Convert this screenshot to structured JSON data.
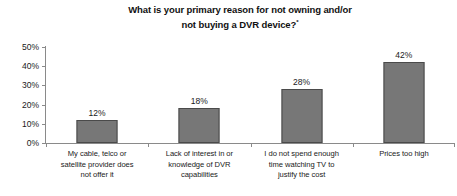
{
  "chart_data": {
    "type": "bar",
    "title": "What is your primary reason for not owning and/or not buying a DVR device?",
    "title_line1": "What is your primary reason for not owning and/or",
    "title_line2": "not buying a DVR device?",
    "title_footnote_mark": "*",
    "xlabel": "",
    "ylabel": "",
    "ylim": [
      0,
      50
    ],
    "grid": false,
    "legend": false,
    "y_ticks": [
      "0%",
      "10%",
      "20%",
      "30%",
      "40%",
      "50%"
    ],
    "y_tick_values": [
      0,
      10,
      20,
      30,
      40,
      50
    ],
    "categories": [
      "My cable, telco or satellite provider does not offer it",
      "Lack of interest in or knowledge of DVR capabilities",
      "I do not spend enough time watching TV to justify the cost",
      "Prices too high"
    ],
    "category_lines": [
      [
        "My cable, telco or",
        "satellite provider does",
        "not offer it"
      ],
      [
        "Lack of interest in or",
        "knowledge of DVR",
        "capabilities"
      ],
      [
        "I do not spend enough",
        "time watching TV to",
        "justify the cost"
      ],
      [
        "Prices too high"
      ]
    ],
    "values": [
      12,
      18,
      28,
      42
    ],
    "value_labels": [
      "12%",
      "18%",
      "28%",
      "42%"
    ],
    "colors": {
      "bar_fill": "#777777",
      "bar_edge": "#4a4a4a",
      "axis": "#8a8a8a",
      "text": "#1a1a1a",
      "background": "#ffffff"
    }
  }
}
